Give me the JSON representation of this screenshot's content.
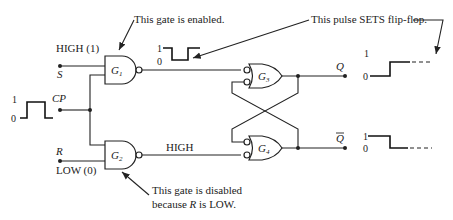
{
  "diagram": {
    "inputs": {
      "s": {
        "label": "S",
        "state": "HIGH (1)"
      },
      "cp": {
        "label": "CP",
        "level_high": "1",
        "level_low": "0"
      },
      "r": {
        "label": "R",
        "state": "LOW (0)"
      }
    },
    "gates": {
      "g1": {
        "name": "G",
        "sub": "1"
      },
      "g2": {
        "name": "G",
        "sub": "2"
      },
      "g3": {
        "name": "G",
        "sub": "3"
      },
      "g4": {
        "name": "G",
        "sub": "4"
      }
    },
    "signals": {
      "g1_out_high": "1",
      "g1_out_low": "0",
      "g2_out": "HIGH"
    },
    "outputs": {
      "q": {
        "label": "Q",
        "level_high": "1",
        "level_low": "0"
      },
      "qbar": {
        "label": "Q",
        "level_high": "1",
        "level_low": "0"
      }
    },
    "annotations": {
      "g1_enabled": "This gate is enabled.",
      "pulse_sets": "This pulse SETS flip-flop.",
      "g2_disabled_line1": "This gate is disabled",
      "g2_disabled_line2_pre": "because ",
      "g2_disabled_line2_var": "R",
      "g2_disabled_line2_post": " is LOW."
    }
  }
}
